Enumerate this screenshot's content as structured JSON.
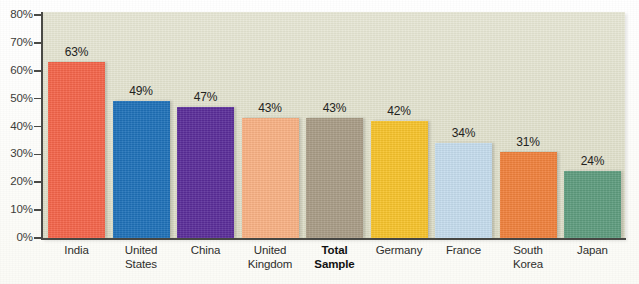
{
  "chart_data": {
    "type": "bar",
    "title": "",
    "subtitle": "",
    "xlabel": "",
    "ylabel": "",
    "ylim": [
      0,
      80
    ],
    "grid": false,
    "legend": "none",
    "y_tick_labels": [
      "80%",
      "70%",
      "60%",
      "50%",
      "40%",
      "30%",
      "20%",
      "10%",
      "0%"
    ],
    "y_tick_values": [
      80,
      70,
      60,
      50,
      40,
      30,
      20,
      10,
      0
    ],
    "categories": [
      "India",
      "United States",
      "China",
      "United Kingdom",
      "Total Sample",
      "Germany",
      "France",
      "South Korea",
      "Japan"
    ],
    "category_lines": [
      [
        "India"
      ],
      [
        "United",
        "States"
      ],
      [
        "China"
      ],
      [
        "United",
        "Kingdom"
      ],
      [
        "Total",
        "Sample"
      ],
      [
        "Germany"
      ],
      [
        "France"
      ],
      [
        "South",
        "Korea"
      ],
      [
        "Japan"
      ]
    ],
    "category_emphasis": [
      false,
      false,
      false,
      false,
      true,
      false,
      false,
      false,
      false
    ],
    "values": [
      63,
      49,
      47,
      43,
      43,
      42,
      34,
      31,
      24
    ],
    "value_labels": [
      "63%",
      "49%",
      "47%",
      "43%",
      "43%",
      "42%",
      "34%",
      "31%",
      "24%"
    ],
    "bar_colors": [
      "#f4644a",
      "#1f71b8",
      "#5a2d99",
      "#f9b184",
      "#a99c86",
      "#f7c32b",
      "#c5dced",
      "#f0813c",
      "#5e9c7e"
    ]
  },
  "style": {
    "plot_background": "#dcdcc6",
    "page_background": "#fdfdf9",
    "axis_color": "#4a4a46",
    "label_color": "#2e2e2c"
  }
}
